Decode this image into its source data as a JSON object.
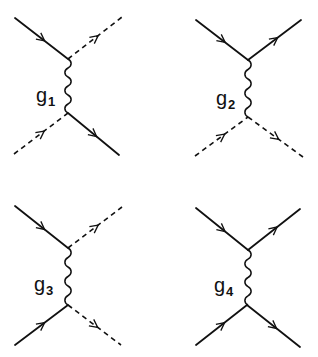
{
  "figure": {
    "type": "feynman-diagrams",
    "layout": "2x2 grid",
    "diagrams": [
      {
        "id": "g1",
        "label": "g",
        "subscript": "1",
        "propagator": "wavy",
        "top_vertex": [
          68,
          59
        ],
        "bottom_vertex": [
          68,
          113
        ],
        "legs": [
          {
            "name": "top-left",
            "style": "solid",
            "from": [
              15,
              18
            ],
            "to": [
              68,
              59
            ],
            "arrow": "in"
          },
          {
            "name": "top-right",
            "style": "dashed",
            "from": [
              68,
              59
            ],
            "to": [
              122,
              17
            ],
            "arrow": "out"
          },
          {
            "name": "bottom-left",
            "style": "dashed",
            "from": [
              14,
              154
            ],
            "to": [
              68,
              113
            ],
            "arrow": "in"
          },
          {
            "name": "bottom-right",
            "style": "solid",
            "from": [
              68,
              113
            ],
            "to": [
              119,
              155
            ],
            "arrow": "out"
          }
        ],
        "label_pos": [
          36,
          102
        ]
      },
      {
        "id": "g2",
        "label": "g",
        "subscript": "2",
        "propagator": "wavy",
        "top_vertex": [
          248,
          60
        ],
        "bottom_vertex": [
          248,
          117
        ],
        "legs": [
          {
            "name": "top-left",
            "style": "solid",
            "from": [
              196,
              20
            ],
            "to": [
              248,
              60
            ],
            "arrow": "in"
          },
          {
            "name": "top-right",
            "style": "solid",
            "from": [
              248,
              60
            ],
            "to": [
              301,
              20
            ],
            "arrow": "out"
          },
          {
            "name": "bottom-left",
            "style": "dashed",
            "from": [
              195,
              156
            ],
            "to": [
              248,
              117
            ],
            "arrow": "in"
          },
          {
            "name": "bottom-right",
            "style": "dashed",
            "from": [
              248,
              117
            ],
            "to": [
              303,
              157
            ],
            "arrow": "out"
          }
        ],
        "label_pos": [
          216,
          105
        ]
      },
      {
        "id": "g3",
        "label": "g",
        "subscript": "3",
        "propagator": "wavy",
        "top_vertex": [
          68,
          248
        ],
        "bottom_vertex": [
          68,
          305
        ],
        "legs": [
          {
            "name": "top-left",
            "style": "solid",
            "from": [
              15,
              206
            ],
            "to": [
              68,
              248
            ],
            "arrow": "in"
          },
          {
            "name": "top-right",
            "style": "dashed",
            "from": [
              68,
              248
            ],
            "to": [
              122,
              207
            ],
            "arrow": "out"
          },
          {
            "name": "bottom-left",
            "style": "solid",
            "from": [
              15,
              345
            ],
            "to": [
              68,
              305
            ],
            "arrow": "in"
          },
          {
            "name": "bottom-right",
            "style": "dashed",
            "from": [
              68,
              305
            ],
            "to": [
              121,
              345
            ],
            "arrow": "out"
          }
        ],
        "label_pos": [
          34,
          291
        ]
      },
      {
        "id": "g4",
        "label": "g",
        "subscript": "4",
        "propagator": "wavy",
        "top_vertex": [
          248,
          250
        ],
        "bottom_vertex": [
          247,
          305
        ],
        "legs": [
          {
            "name": "top-left",
            "style": "solid",
            "from": [
              196,
              208
            ],
            "to": [
              248,
              250
            ],
            "arrow": "in"
          },
          {
            "name": "top-right",
            "style": "solid",
            "from": [
              248,
              250
            ],
            "to": [
              300,
              209
            ],
            "arrow": "out"
          },
          {
            "name": "bottom-left",
            "style": "solid",
            "from": [
              196,
              345
            ],
            "to": [
              247,
              305
            ],
            "arrow": "in"
          },
          {
            "name": "bottom-right",
            "style": "solid",
            "from": [
              247,
              305
            ],
            "to": [
              300,
              347
            ],
            "arrow": "out"
          }
        ],
        "label_pos": [
          214,
          292
        ]
      }
    ]
  },
  "colors": {
    "line": "#111111",
    "background": "#ffffff"
  }
}
